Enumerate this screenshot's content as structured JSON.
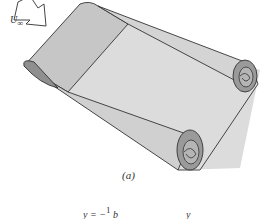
{
  "figure": {
    "panel_label": "(a)",
    "freestream_label": "U",
    "freestream_subscript": "∞",
    "equation_lhs": "y = −",
    "equation_frac": "1",
    "equation_rhs": "b",
    "axis_var": "y",
    "colors": {
      "sheet_light": "#d9d9d9",
      "sheet_mid": "#c4c4c4",
      "roll_dark": "#8c8c8c",
      "outline": "#333333"
    }
  }
}
